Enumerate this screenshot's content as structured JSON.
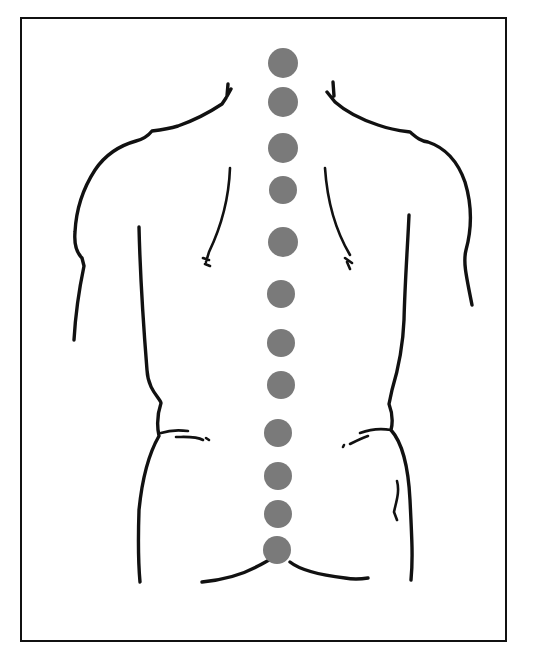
{
  "figure": {
    "description": "Back view of human torso outline with dots marking the spine",
    "frame": {
      "x": 21,
      "y": 18,
      "width": 485,
      "height": 623,
      "stroke": "#111111"
    },
    "colors": {
      "line": "#111111",
      "dot": "#7a7a7a",
      "background": "#ffffff"
    },
    "spine_dots": {
      "count": 12,
      "cx": 283,
      "radius": 15,
      "cy": [
        63,
        102,
        148,
        190,
        242,
        294,
        343,
        385,
        433,
        476,
        514,
        550
      ]
    }
  }
}
